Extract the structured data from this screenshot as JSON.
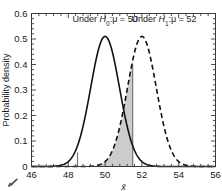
{
  "chart_data": {
    "type": "line",
    "title": "",
    "xlabel": "x̄",
    "ylabel": "Probability density",
    "xlim": [
      46,
      56
    ],
    "ylim": [
      0,
      0.6
    ],
    "xticks": [
      46,
      48,
      50,
      52,
      54,
      56
    ],
    "xtick_labels": [
      "46",
      "48",
      "50",
      "52",
      "54",
      "56"
    ],
    "yticks": [
      0,
      0.1,
      0.2,
      0.3,
      0.4,
      0.5,
      0.6
    ],
    "ytick_labels": [
      "0",
      "0.1",
      "0.2",
      "0.3",
      "0.4",
      "0.5",
      "0.6"
    ],
    "minor_tick_count": 4,
    "grid": false,
    "legend_position": "none",
    "series": [
      {
        "name": "Under H0: mu = 50",
        "style": "solid",
        "distribution": "normal",
        "mean": 50,
        "sigma": 0.782,
        "peak_density": 0.51,
        "color": "#111111"
      },
      {
        "name": "Under H1: mu = 52",
        "style": "dashed",
        "distribution": "normal",
        "mean": 52,
        "sigma": 0.782,
        "peak_density": 0.51,
        "color": "#111111"
      }
    ],
    "shaded_region": {
      "label": "beta region",
      "under_series": "Under H1: mu = 52",
      "x_from": 49.6,
      "x_to": 51.5,
      "color": "#c9c9c9"
    },
    "vertical_lines": [
      {
        "x": 48.5,
        "y_from": 0,
        "y_to": 0.055,
        "color": "#6d6d6d"
      },
      {
        "x": 51.5,
        "y_from": 0,
        "y_to": 0.4,
        "color": "#6d6d6d"
      }
    ],
    "annotations": [
      {
        "id": "annot-h0",
        "text_prefix": "Under ",
        "symbol": "H",
        "subscript": "0",
        "text_middle": ":μ = ",
        "value": "50",
        "x": 50,
        "y": 0.565
      },
      {
        "id": "annot-h1",
        "text_prefix": "Under ",
        "symbol": "H",
        "subscript": "1",
        "text_middle": ":μ = ",
        "value": "52",
        "x": 53.2,
        "y": 0.565
      }
    ]
  },
  "axes": {
    "y_axis_title": "Probability density",
    "x_axis_title": "x̄"
  },
  "colors": {
    "frame": "#3a3a3a",
    "curve": "#111111",
    "shade": "#c9c9c9",
    "vline": "#6d6d6d",
    "background": "#ffffff"
  }
}
